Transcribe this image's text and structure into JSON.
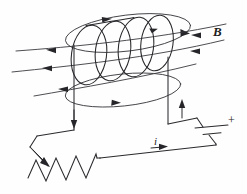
{
  "figure": {
    "background_color": "#fefefe",
    "line_color": "#2a2a2e",
    "width": 247,
    "height": 194
  },
  "labels": {
    "magnetic_field": "B",
    "current": "i",
    "battery_positive": "+"
  },
  "components": {
    "solenoid": {
      "name": "solenoid-coil",
      "turns": 4
    },
    "battery": {
      "name": "battery",
      "positive_terminal_label": "+"
    },
    "resistor": {
      "name": "resistor",
      "zigzag_peaks": 4
    },
    "field_lines": {
      "name": "magnetic-field-lines",
      "left_lines": 3,
      "right_lines": 2,
      "loops": 2
    }
  }
}
